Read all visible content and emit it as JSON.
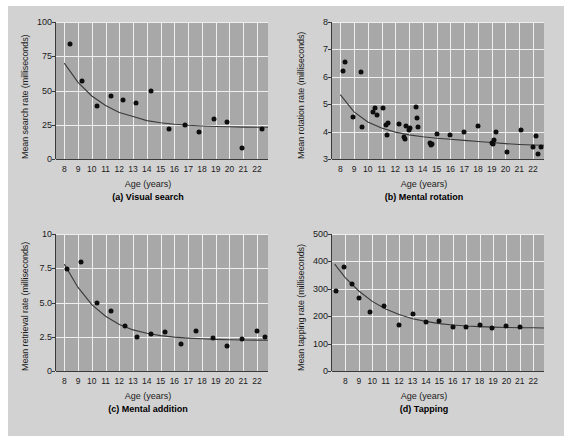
{
  "figure": {
    "background_color": "#d2d2d2",
    "plot_background_color": "#a8a8a8",
    "gridline_color": "#efefef",
    "point_color": "#0d0d0d",
    "curve_color": "#3a3a3a"
  },
  "chart_data": [
    {
      "id": "panel-a",
      "type": "scatter",
      "title": "(a) Visual search",
      "xlabel": "Age (years)",
      "ylabel": "Mean search rate (milliseconds)",
      "xlim": [
        7.4,
        22.8
      ],
      "ylim": [
        0,
        100
      ],
      "xticks": [
        8,
        9,
        10,
        11,
        12,
        13,
        14,
        15,
        16,
        17,
        18,
        19,
        20,
        21,
        22
      ],
      "yticks": [
        0,
        25,
        50,
        75,
        100
      ],
      "ytick_labels": [
        "0",
        "25",
        "50",
        "75",
        "100"
      ],
      "grid": true,
      "legend": "none",
      "x": [
        8.4,
        9.3,
        10.4,
        11.4,
        12.3,
        13.2,
        14.3,
        15.6,
        16.8,
        17.8,
        18.9,
        19.8,
        20.9,
        22.4
      ],
      "y": [
        84,
        57,
        39,
        46,
        43,
        41,
        50,
        22,
        25,
        20,
        29,
        27,
        8,
        22
      ],
      "fit_curve": {
        "description": "decaying power/exponential fit leveling near 23 ms",
        "x": [
          8.0,
          9.0,
          10.0,
          11.0,
          12.0,
          13.0,
          14.0,
          15.0,
          16.0,
          17.0,
          18.0,
          19.0,
          20.0,
          21.0,
          22.0,
          22.8
        ],
        "y": [
          70,
          56,
          46,
          39,
          34,
          31,
          28,
          26.5,
          25.4,
          24.6,
          24.1,
          23.7,
          23.5,
          23.3,
          23.2,
          23.2
        ]
      }
    },
    {
      "id": "panel-b",
      "type": "scatter",
      "title": "(b) Mental rotation",
      "xlabel": "Age (years)",
      "ylabel": "Mean rotation rate (milliseconds)",
      "xlim": [
        7.4,
        22.8
      ],
      "ylim": [
        3,
        8
      ],
      "xticks": [
        8,
        9,
        10,
        11,
        12,
        13,
        14,
        15,
        16,
        17,
        18,
        19,
        20,
        21,
        22
      ],
      "yticks": [
        3,
        4,
        5,
        6,
        7,
        8
      ],
      "ytick_labels": [
        "3",
        "4",
        "5",
        "6",
        "7",
        "8"
      ],
      "grid": true,
      "legend": "none",
      "x": [
        8.2,
        8.35,
        8.9,
        9.5,
        9.55,
        10.4,
        10.5,
        10.7,
        11.1,
        11.3,
        11.4,
        11.5,
        12.3,
        12.6,
        12.7,
        12.75,
        13.0,
        13.1,
        13.5,
        13.6,
        13.65,
        14.5,
        14.6,
        14.7,
        15.0,
        16.0,
        17.0,
        18.0,
        19.0,
        19.1,
        19.2,
        19.3,
        20.1,
        21.1,
        22.0,
        22.2,
        22.4,
        22.6
      ],
      "y": [
        6.2,
        6.55,
        4.55,
        6.17,
        4.17,
        4.7,
        4.87,
        4.6,
        4.85,
        4.25,
        3.87,
        4.3,
        4.28,
        3.8,
        3.72,
        4.22,
        4.05,
        4.12,
        4.9,
        4.5,
        4.17,
        3.6,
        3.5,
        3.55,
        3.9,
        3.88,
        4.0,
        4.2,
        3.6,
        3.55,
        3.7,
        4.0,
        3.25,
        4.05,
        3.45,
        3.85,
        3.2,
        3.45
      ],
      "fit_curve": {
        "description": "decaying curve from ~5.35 at age 8 flattening near 3.5",
        "x": [
          8.0,
          9.0,
          10.0,
          11.0,
          12.0,
          13.0,
          14.0,
          15.0,
          16.0,
          17.0,
          18.0,
          19.0,
          20.0,
          21.0,
          22.0,
          22.8
        ],
        "y": [
          5.35,
          4.72,
          4.35,
          4.13,
          3.98,
          3.88,
          3.81,
          3.76,
          3.72,
          3.68,
          3.64,
          3.6,
          3.56,
          3.53,
          3.51,
          3.5
        ]
      }
    },
    {
      "id": "panel-c",
      "type": "scatter",
      "title": "(c) Mental addition",
      "xlabel": "Age (years)",
      "ylabel": "Mean retrieval rate (milliseconds)",
      "xlim": [
        7.4,
        22.8
      ],
      "ylim": [
        0,
        10
      ],
      "xticks": [
        8,
        9,
        10,
        11,
        12,
        13,
        14,
        15,
        16,
        17,
        18,
        19,
        20,
        21,
        22
      ],
      "yticks": [
        0,
        2.5,
        5.0,
        7.5,
        10
      ],
      "ytick_labels": [
        "0",
        "2.5",
        "5.0",
        "7.5",
        "10"
      ],
      "grid": true,
      "legend": "none",
      "x": [
        8.2,
        9.2,
        10.4,
        11.4,
        12.4,
        13.3,
        14.3,
        15.3,
        16.5,
        17.6,
        18.8,
        19.8,
        20.9,
        22.0,
        22.6
      ],
      "y": [
        7.45,
        7.95,
        4.97,
        4.35,
        3.25,
        2.5,
        2.68,
        2.82,
        2.0,
        2.95,
        2.4,
        1.8,
        2.3,
        2.9,
        2.45
      ],
      "fit_curve": {
        "description": "sharp decay from ~7.8 leveling near 2.25",
        "x": [
          8.0,
          9.0,
          10.0,
          11.0,
          12.0,
          13.0,
          14.0,
          15.0,
          16.0,
          17.0,
          18.0,
          19.0,
          20.0,
          21.0,
          22.0,
          22.8
        ],
        "y": [
          7.8,
          6.1,
          4.85,
          4.0,
          3.4,
          3.0,
          2.75,
          2.58,
          2.47,
          2.4,
          2.35,
          2.31,
          2.28,
          2.26,
          2.25,
          2.24
        ]
      }
    },
    {
      "id": "panel-d",
      "type": "scatter",
      "title": "(d) Tapping",
      "xlabel": "Age (years)",
      "ylabel": "Mean tapping rate (milliseconds)",
      "xlim": [
        7.0,
        22.8
      ],
      "ylim": [
        0,
        500
      ],
      "xticks": [
        8,
        9,
        10,
        11,
        12,
        13,
        14,
        15,
        16,
        17,
        18,
        19,
        20,
        21,
        22
      ],
      "yticks": [
        0,
        100,
        200,
        300,
        400,
        500
      ],
      "ytick_labels": [
        "0",
        "100",
        "200",
        "300",
        "400",
        "500"
      ],
      "grid": true,
      "legend": "none",
      "x": [
        7.3,
        7.9,
        8.5,
        9.0,
        9.8,
        10.9,
        12.0,
        13.0,
        14.0,
        15.0,
        16.0,
        17.0,
        18.0,
        18.9,
        20.0,
        21.0
      ],
      "y": [
        292,
        381,
        319,
        268,
        215,
        236,
        168,
        207,
        178,
        184,
        160,
        160,
        169,
        157,
        165,
        162
      ],
      "fit_curve": {
        "description": "exponential decay from ~390 leveling near 158",
        "x": [
          7.2,
          8.0,
          9.0,
          10.0,
          11.0,
          12.0,
          13.0,
          14.0,
          15.0,
          16.0,
          17.0,
          18.0,
          19.0,
          20.0,
          21.0,
          22.0,
          22.8
        ],
        "y": [
          390,
          340,
          292,
          254,
          226,
          206,
          191,
          181,
          173,
          168,
          164,
          162,
          160,
          159,
          158,
          158,
          157
        ]
      }
    }
  ]
}
